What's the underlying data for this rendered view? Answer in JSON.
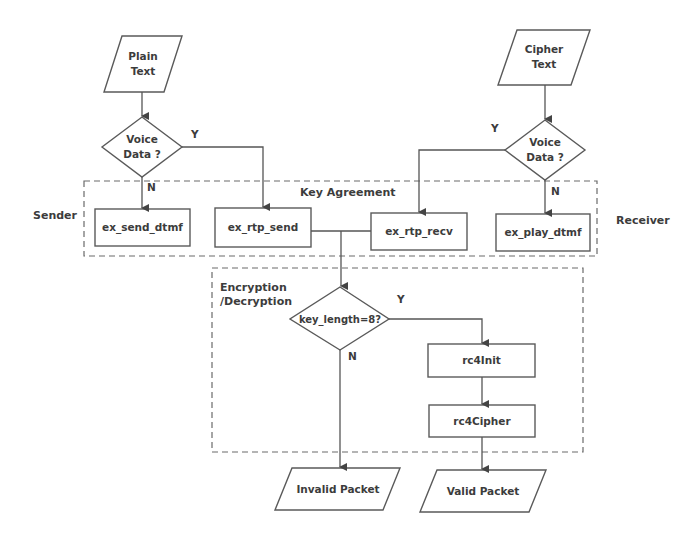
{
  "diagram": {
    "type": "flowchart",
    "groups": {
      "key_agreement": "Key Agreement",
      "encryption": "Encryption\n/Decryption"
    },
    "side_labels": {
      "sender": "Sender",
      "receiver": "Receiver"
    },
    "inputs": {
      "plain_text": "Plain\nText",
      "cipher_text": "Cipher\nText"
    },
    "decisions": {
      "voice_left": "Voice\nData ?",
      "voice_right": "Voice\nData ?",
      "key_length": "key_length=8?"
    },
    "processes": {
      "send_dtmf": "ex_send_dtmf",
      "rtp_send": "ex_rtp_send",
      "rtp_recv": "ex_rtp_recv",
      "play_dtmf": "ex_play_dtmf",
      "rc4init": "rc4Init",
      "rc4cipher": "rc4Cipher"
    },
    "outputs": {
      "invalid": "Invalid Packet",
      "valid": "Valid Packet"
    },
    "branch_labels": {
      "left_yes": "Y",
      "left_no": "N",
      "right_yes": "Y",
      "right_no": "N",
      "key_yes": "Y",
      "key_no": "N"
    }
  }
}
